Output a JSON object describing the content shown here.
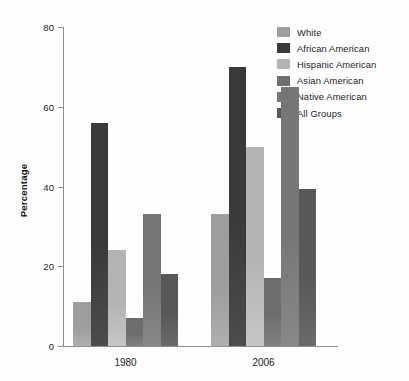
{
  "chart_data": {
    "type": "bar",
    "title": "",
    "xlabel": "",
    "ylabel": "Percentage",
    "ylim": [
      0,
      80
    ],
    "yticks": [
      0,
      20,
      40,
      60,
      80
    ],
    "ytick_labels": [
      "0",
      "20",
      "40",
      "60",
      "80"
    ],
    "grid": false,
    "legend_position": "top-right",
    "categories": [
      "1980",
      "2006"
    ],
    "series": [
      {
        "name": "White",
        "color": "#9d9d9d",
        "values": [
          11,
          33
        ]
      },
      {
        "name": "African American",
        "color": "#3a3a3a",
        "values": [
          56,
          70
        ]
      },
      {
        "name": "Hispanic American",
        "color": "#b4b4b4",
        "values": [
          24,
          50
        ]
      },
      {
        "name": "Asian American",
        "color": "#6e6e6e",
        "values": [
          7,
          17
        ]
      },
      {
        "name": "Native American",
        "color": "#767676",
        "values": [
          33,
          65
        ]
      },
      {
        "name": "All Groups",
        "color": "#585858",
        "values": [
          18,
          39.5
        ]
      }
    ]
  },
  "legend": {
    "items": [
      {
        "label": "White"
      },
      {
        "label": "African American"
      },
      {
        "label": "Hispanic American"
      },
      {
        "label": "Asian American"
      },
      {
        "label": "Native American"
      },
      {
        "label": "All Groups"
      }
    ]
  },
  "axes": {
    "y_title": "Percentage"
  }
}
